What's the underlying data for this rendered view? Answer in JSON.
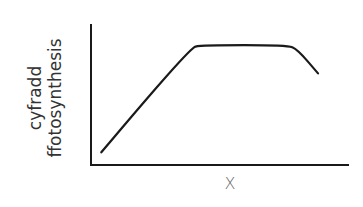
{
  "chart_data": {
    "type": "line",
    "title": "",
    "xlabel": "X",
    "ylabel_lines": [
      "cyfradd",
      "ffotosynthesis"
    ],
    "ylabel": "cyfradd ffotosynthesis",
    "grid": false,
    "legend": null,
    "ticks": false,
    "xlim": [
      0,
      100
    ],
    "ylim": [
      0,
      100
    ],
    "series": [
      {
        "name": "rate",
        "color": "#1a1a1a",
        "points": [
          {
            "x": 4,
            "y": 9
          },
          {
            "x": 38,
            "y": 83
          },
          {
            "x": 43,
            "y": 85
          },
          {
            "x": 76,
            "y": 85
          },
          {
            "x": 80,
            "y": 82
          },
          {
            "x": 88,
            "y": 65
          }
        ]
      }
    ],
    "shape_description": "linear rise, long plateau, then decline"
  }
}
